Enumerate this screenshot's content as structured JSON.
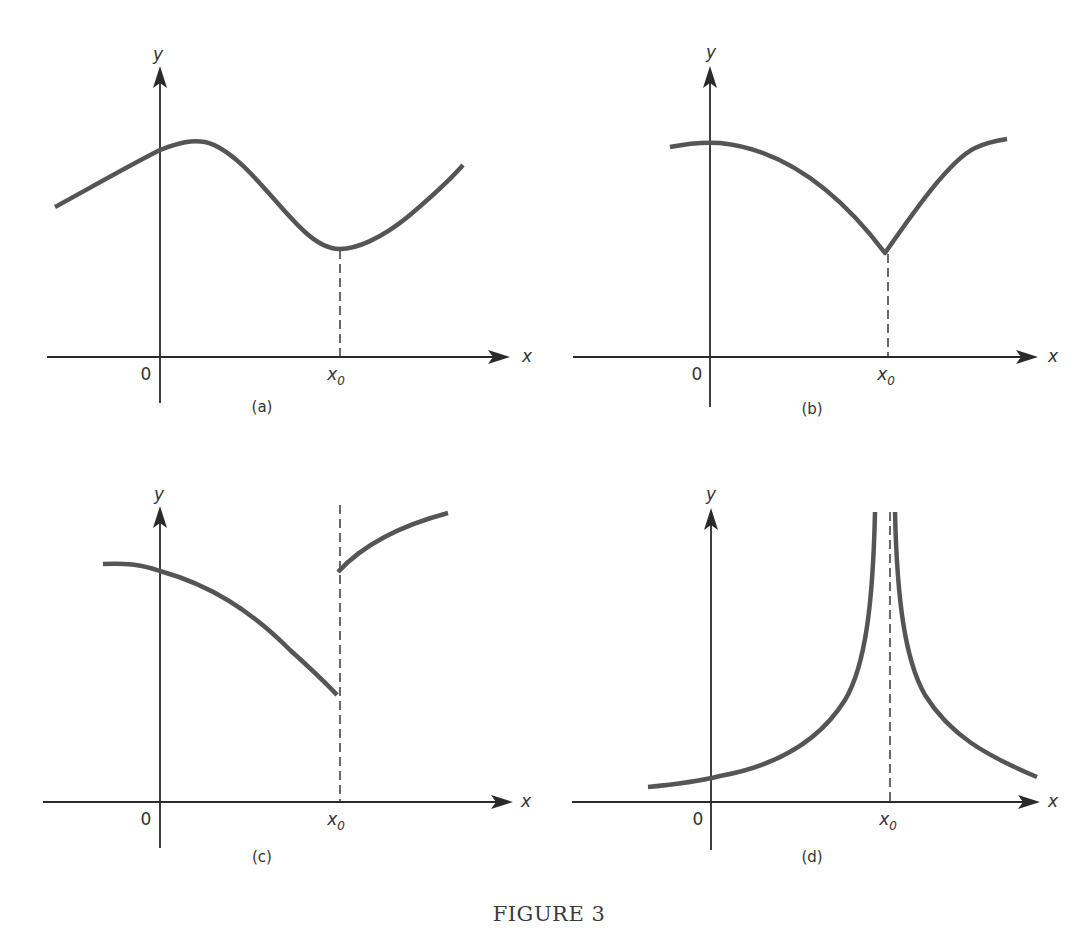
{
  "figure": {
    "title": "FIGURE 3"
  },
  "panels": [
    {
      "id": "a",
      "caption": "(a)",
      "x_label": "x",
      "y_label": "y",
      "origin_label": "0",
      "x0_label": "x",
      "x0_sub": "0"
    },
    {
      "id": "b",
      "caption": "(b)",
      "x_label": "x",
      "y_label": "y",
      "origin_label": "0",
      "x0_label": "x",
      "x0_sub": "0"
    },
    {
      "id": "c",
      "caption": "(c)",
      "x_label": "x",
      "y_label": "y",
      "origin_label": "0",
      "x0_label": "x",
      "x0_sub": "0"
    },
    {
      "id": "d",
      "caption": "(d)",
      "x_label": "x",
      "y_label": "y",
      "origin_label": "0",
      "x0_label": "x",
      "x0_sub": "0"
    }
  ],
  "colors": {
    "curve": "#555555",
    "axis": "#2a2a2a",
    "background": "#ffffff"
  }
}
